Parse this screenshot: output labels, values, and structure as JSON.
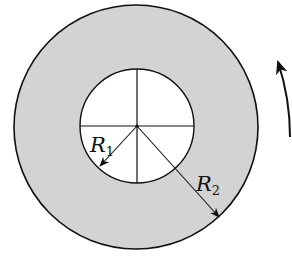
{
  "diagram": {
    "type": "annulus",
    "colors": {
      "ring_fill": "#d3d3d3",
      "inner_fill": "#ffffff",
      "stroke": "#111111"
    },
    "center": [
      136,
      127
    ],
    "outer_radius": 123,
    "inner_radius": 57,
    "labels": {
      "inner_radius": {
        "main": "R",
        "sub": "1"
      },
      "outer_radius": {
        "main": "R",
        "sub": "2"
      }
    },
    "rotation_arrow": {
      "direction": "counterclockwise"
    }
  }
}
